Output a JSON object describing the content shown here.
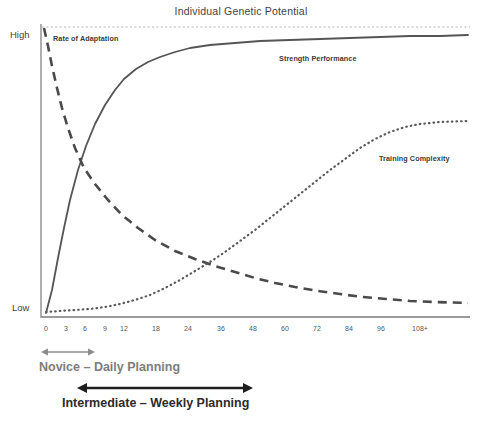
{
  "chart_data": {
    "type": "line",
    "title": "Individual Genetic Potential",
    "xlabel": "",
    "ylabel": "",
    "grid": false,
    "legend_position": "inline-labels",
    "y_tick_labels": [
      "High",
      "Low"
    ],
    "ylim": [
      0,
      100
    ],
    "categories": [
      "0",
      "3",
      "6",
      "9",
      "12",
      "18",
      "24",
      "36",
      "48",
      "60",
      "72",
      "84",
      "96",
      "108+"
    ],
    "x_tick_labels": [
      "0",
      "3",
      "6",
      "9",
      "12",
      "18",
      "24",
      "36",
      "48",
      "60",
      "72",
      "84",
      "96",
      "108+"
    ],
    "x_tick_positions_px": [
      46,
      66,
      85,
      105,
      124,
      156,
      188,
      221,
      253,
      285,
      317,
      349,
      381,
      420
    ],
    "annotations": [
      "Individual Genetic Potential",
      "Rate of Adaptation",
      "Strength Performance",
      "Training Complexity",
      "Novice – Daily Planning",
      "Intermediate – Weekly Planning"
    ],
    "series": [
      {
        "name": "Strength Performance",
        "style": "solid",
        "color": "#555555",
        "values": [
          2,
          22,
          44,
          61,
          73,
          84,
          89,
          93,
          95,
          96,
          97,
          98,
          98,
          99
        ],
        "points_px": [
          [
            46,
            313
          ],
          [
            52,
            290
          ],
          [
            58,
            258
          ],
          [
            64,
            228
          ],
          [
            70,
            200
          ],
          [
            78,
            170
          ],
          [
            86,
            146
          ],
          [
            95,
            124
          ],
          [
            105,
            105
          ],
          [
            115,
            90
          ],
          [
            124,
            79
          ],
          [
            136,
            69
          ],
          [
            148,
            62
          ],
          [
            160,
            57
          ],
          [
            175,
            52
          ],
          [
            190,
            48
          ],
          [
            210,
            45
          ],
          [
            235,
            43
          ],
          [
            260,
            41
          ],
          [
            290,
            40
          ],
          [
            320,
            39
          ],
          [
            350,
            38
          ],
          [
            380,
            37
          ],
          [
            410,
            36
          ],
          [
            440,
            36
          ],
          [
            468,
            35
          ]
        ]
      },
      {
        "name": "Rate of Adaptation",
        "style": "dashed",
        "color": "#4a4a4a",
        "values": [
          100,
          84,
          68,
          56,
          46,
          34,
          26,
          18,
          13,
          10,
          8,
          6,
          5,
          4
        ],
        "points_px": [
          [
            44,
            28
          ],
          [
            48,
            46
          ],
          [
            52,
            66
          ],
          [
            57,
            88
          ],
          [
            62,
            108
          ],
          [
            68,
            128
          ],
          [
            75,
            148
          ],
          [
            84,
            168
          ],
          [
            95,
            184
          ],
          [
            108,
            200
          ],
          [
            122,
            215
          ],
          [
            138,
            228
          ],
          [
            155,
            240
          ],
          [
            175,
            251
          ],
          [
            195,
            259
          ],
          [
            215,
            266
          ],
          [
            235,
            272
          ],
          [
            255,
            278
          ],
          [
            275,
            283
          ],
          [
            295,
            287
          ],
          [
            318,
            291
          ],
          [
            340,
            294
          ],
          [
            362,
            297
          ],
          [
            386,
            299
          ],
          [
            410,
            301
          ],
          [
            435,
            302
          ],
          [
            468,
            303
          ]
        ]
      },
      {
        "name": "Training Complexity",
        "style": "dotted",
        "color": "#5a5a5a",
        "values": [
          3,
          3,
          4,
          5,
          6,
          9,
          13,
          22,
          34,
          48,
          62,
          74,
          82,
          86
        ],
        "points_px": [
          [
            46,
            312
          ],
          [
            60,
            311
          ],
          [
            75,
            310
          ],
          [
            90,
            309
          ],
          [
            105,
            307
          ],
          [
            120,
            304
          ],
          [
            135,
            300
          ],
          [
            150,
            295
          ],
          [
            165,
            288
          ],
          [
            180,
            280
          ],
          [
            195,
            271
          ],
          [
            210,
            262
          ],
          [
            225,
            252
          ],
          [
            240,
            241
          ],
          [
            255,
            230
          ],
          [
            270,
            218
          ],
          [
            285,
            206
          ],
          [
            300,
            194
          ],
          [
            315,
            182
          ],
          [
            330,
            170
          ],
          [
            345,
            159
          ],
          [
            360,
            148
          ],
          [
            375,
            139
          ],
          [
            390,
            132
          ],
          [
            405,
            127
          ],
          [
            420,
            124
          ],
          [
            440,
            122
          ],
          [
            468,
            121
          ]
        ]
      }
    ],
    "reference_line": {
      "label": "Individual Genetic Potential",
      "style": "dotted",
      "y_px": 27
    },
    "phase_markers": [
      {
        "label": "Novice – Daily Planning",
        "range": "0–9",
        "arrow_color": "#8c8c8c",
        "arrow_x_start_px": 43,
        "arrow_x_end_px": 93,
        "arrow_y_px": 352
      },
      {
        "label": "Intermediate – Weekly Planning",
        "range": "6–48",
        "arrow_color": "#1e1e1e",
        "arrow_x_start_px": 78,
        "arrow_x_end_px": 252,
        "arrow_y_px": 388
      }
    ]
  },
  "colors": {
    "axis": "#9a9a9a",
    "solid_curve": "#555555",
    "dashed_curve": "#4a4a4a",
    "dotted_curve": "#5a5a5a",
    "title_text": "#3f3f3f",
    "novice_arrow": "#8c8c8c",
    "intermediate_arrow": "#1e1e1e",
    "background": "#ffffff"
  }
}
